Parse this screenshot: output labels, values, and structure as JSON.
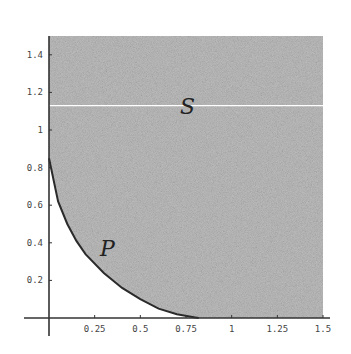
{
  "chart_data": {
    "type": "area",
    "title": "",
    "xlabel": "",
    "ylabel": "",
    "xlim": [
      0,
      1.5
    ],
    "ylim": [
      0,
      1.5
    ],
    "grid": false,
    "legend": null,
    "x_ticks": [
      "0.25",
      "0.5",
      "0.75",
      "1",
      "1.25",
      "1.5"
    ],
    "y_ticks": [
      "0.2",
      "0.4",
      "0.6",
      "0.8",
      "1",
      "1.2",
      "1.4"
    ],
    "regions": [
      {
        "name": "S",
        "description": "shaded region bounded by x in [0,1.5], y in [0,1.5], above curve P boundary",
        "fill": "#b8b8b8"
      },
      {
        "name": "P",
        "description": "region under shaded area bounded by convex decreasing curve",
        "fill": "#b8b8b8"
      }
    ],
    "curve": {
      "name": "boundary",
      "x": [
        0,
        0.05,
        0.1,
        0.15,
        0.2,
        0.3,
        0.4,
        0.5,
        0.6,
        0.7,
        0.8,
        0.82
      ],
      "y": [
        0.85,
        0.62,
        0.5,
        0.41,
        0.34,
        0.24,
        0.16,
        0.1,
        0.05,
        0.02,
        0.003,
        0
      ]
    },
    "horizontal_line": {
      "y": 1.13,
      "color": "#ffffff"
    },
    "annotations": [
      {
        "text": "S",
        "x": 0.78,
        "y": 1.05
      },
      {
        "text": "P",
        "x": 0.35,
        "y": 0.35
      }
    ]
  },
  "labels": {
    "S": "S",
    "P": "P"
  }
}
